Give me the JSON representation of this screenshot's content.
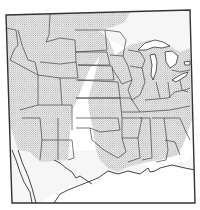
{
  "map": {
    "title": "",
    "region": "Central and eastern United States",
    "legend": [],
    "shading": {
      "pattern": "stipple",
      "meaning": "range (shaded area)",
      "colors": {
        "dots": "#8a8a8a",
        "background": "#ffffff",
        "light_fade": "#ececec"
      }
    },
    "features": [
      "state boundaries",
      "Great Lakes",
      "Gulf coast",
      "Rio Grande"
    ],
    "labels": []
  }
}
